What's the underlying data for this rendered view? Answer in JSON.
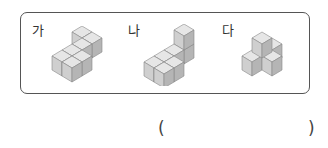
{
  "problem": {
    "figures": [
      {
        "label": "가",
        "cubes": 5,
        "description": "L-shaped single layer plus one stacked cube, 2x2 footprint with extension"
      },
      {
        "label": "나",
        "cubes": 5,
        "description": "Two-layer: tower of two at back, three cubes in front row"
      },
      {
        "label": "다",
        "cubes": 5,
        "description": "Pyramid-like: three bottom cubes with one on top"
      }
    ],
    "answer_open": "(",
    "answer_close": ")"
  },
  "colors": {
    "frame": "#555555",
    "cube_top": "#e6e6e6",
    "cube_left": "#cfcfcf",
    "cube_right": "#b5b5b5",
    "cube_edge": "#888888"
  }
}
